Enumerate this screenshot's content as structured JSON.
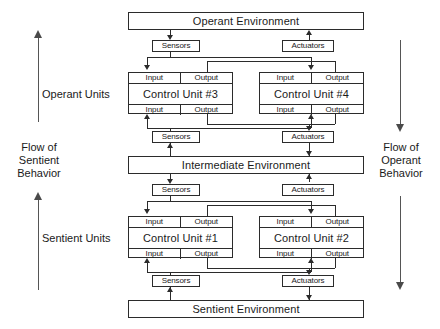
{
  "diagram": {
    "environments": [
      {
        "id": "operant-environment",
        "label": "Operant Environment"
      },
      {
        "id": "intermediate-environment",
        "label": "Intermediate Environment"
      },
      {
        "id": "sentient-environment",
        "label": "Sentient Environment"
      }
    ],
    "interface_blocks": {
      "sensors_label": "Sensors",
      "actuators_label": "Actuators"
    },
    "port_labels": {
      "input": "Input",
      "output": "Output"
    },
    "control_units": [
      {
        "id": "control-unit-3",
        "label": "Control Unit #3",
        "group": "operant"
      },
      {
        "id": "control-unit-4",
        "label": "Control Unit #4",
        "group": "operant"
      },
      {
        "id": "control-unit-1",
        "label": "Control Unit #1",
        "group": "sentient"
      },
      {
        "id": "control-unit-2",
        "label": "Control Unit #2",
        "group": "sentient"
      }
    ],
    "group_labels": [
      {
        "id": "operant-units",
        "label": "Operant Units"
      },
      {
        "id": "sentient-units",
        "label": "Sentient Units"
      }
    ],
    "flow_labels": {
      "left": {
        "id": "flow-of-sentient-behavior",
        "line1": "Flow of",
        "line2": "Sentient",
        "line3": "Behavior",
        "direction": "up"
      },
      "right": {
        "id": "flow-of-operant-behavior",
        "line1": "Flow of",
        "line2": "Operant",
        "line3": "Behavior",
        "direction": "down"
      }
    },
    "colors": {
      "stroke": "#2b2b2b",
      "flow_arrow": "#4a4a4a",
      "background": "#ffffff",
      "text": "#1a1a1a"
    }
  }
}
